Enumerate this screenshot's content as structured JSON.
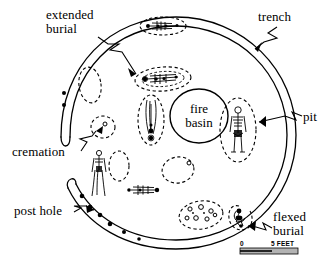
{
  "figure": {
    "type": "archaeological-site-plan"
  },
  "labels": {
    "extended_burial": "extended\nburial",
    "trench": "trench",
    "pit": "pit",
    "cremation": "cremation",
    "post_hole": "post hole",
    "flexed_burial": "flexed\nburial",
    "fire_basin": "fire\nbasin"
  },
  "scale": {
    "start": "0",
    "end": "5 FEET",
    "bar_fill": "#b3b3b3",
    "bar_outline": "#000000"
  },
  "colors": {
    "ink": "#000000",
    "background": "#ffffff",
    "scale_bar": "#b3b3b3"
  },
  "features": {
    "trench_description": "Double-line circular trench, open on the west side, with rounded termini",
    "post_holes_count": 9,
    "pits_dashed_count": 12,
    "burials": [
      {
        "name": "extended-burial-north",
        "orientation": "horizontal"
      },
      {
        "name": "extended-burial-center",
        "orientation": "horizontal"
      },
      {
        "name": "bundle-burial-center",
        "orientation": "vertical"
      },
      {
        "name": "extended-burial-east",
        "orientation": "vertical"
      },
      {
        "name": "burial-west",
        "orientation": "vertical"
      },
      {
        "name": "extended-burial-south",
        "orientation": "horizontal"
      },
      {
        "name": "flexed-burial-southeast",
        "orientation": "flexed"
      }
    ],
    "cremation_description": "Small dashed pit containing a single circular deposit",
    "artifact_cache_description": "Dashed oval pit containing multiple small circular artifacts"
  }
}
